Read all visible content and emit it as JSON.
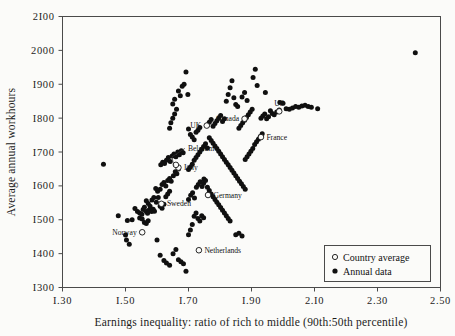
{
  "chart_data": {
    "type": "scatter",
    "title": "",
    "xlabel": "Earnings inequality: ratio of rich to middle (90th:50th percentile)",
    "ylabel": "Average annual workhours",
    "xlim": [
      1.3,
      2.5
    ],
    "ylim": [
      1300,
      2100
    ],
    "xticks": [
      1.3,
      1.5,
      1.7,
      1.9,
      2.1,
      2.3,
      2.5
    ],
    "xticklabels": [
      "1.30",
      "1.50",
      "1.70",
      "1.90",
      "2.10",
      "2.30",
      "2.50"
    ],
    "yticks": [
      1300,
      1400,
      1500,
      1600,
      1700,
      1800,
      1900,
      2000,
      2100
    ],
    "yticklabels": [
      "1300",
      "1400",
      "1500",
      "1600",
      "1700",
      "1800",
      "1900",
      "2000",
      "2100"
    ],
    "grid": false,
    "legend_position": "bottom-right",
    "legend": [
      {
        "marker": "open-circle",
        "label": "Country average"
      },
      {
        "marker": "filled-dot",
        "label": "Annual data"
      }
    ],
    "series": [
      {
        "name": "Annual data",
        "marker": "filled-dot",
        "points": [
          [
            1.477,
            1512
          ],
          [
            1.506,
            1498
          ],
          [
            1.5,
            1455
          ],
          [
            1.503,
            1440
          ],
          [
            1.512,
            1428
          ],
          [
            1.53,
            1533
          ],
          [
            1.538,
            1524
          ],
          [
            1.545,
            1520
          ],
          [
            1.552,
            1516
          ],
          [
            1.556,
            1530
          ],
          [
            1.56,
            1537
          ],
          [
            1.566,
            1524
          ],
          [
            1.57,
            1519
          ],
          [
            1.574,
            1528
          ],
          [
            1.579,
            1527
          ],
          [
            1.583,
            1524
          ],
          [
            1.588,
            1531
          ],
          [
            1.592,
            1525
          ],
          [
            1.56,
            1492
          ],
          [
            1.566,
            1489
          ],
          [
            1.572,
            1497
          ],
          [
            1.545,
            1505
          ],
          [
            1.553,
            1502
          ],
          [
            1.521,
            1500
          ],
          [
            1.598,
            1552
          ],
          [
            1.604,
            1566
          ],
          [
            1.61,
            1590
          ],
          [
            1.616,
            1604
          ],
          [
            1.622,
            1610
          ],
          [
            1.628,
            1600
          ],
          [
            1.634,
            1616
          ],
          [
            1.64,
            1622
          ],
          [
            1.645,
            1614
          ],
          [
            1.652,
            1630
          ],
          [
            1.658,
            1642
          ],
          [
            1.663,
            1636
          ],
          [
            1.668,
            1650
          ],
          [
            1.612,
            1662
          ],
          [
            1.618,
            1670
          ],
          [
            1.624,
            1666
          ],
          [
            1.63,
            1676
          ],
          [
            1.636,
            1684
          ],
          [
            1.642,
            1672
          ],
          [
            1.648,
            1688
          ],
          [
            1.654,
            1694
          ],
          [
            1.66,
            1686
          ],
          [
            1.666,
            1700
          ],
          [
            1.671,
            1692
          ],
          [
            1.677,
            1704
          ],
          [
            1.683,
            1698
          ],
          [
            1.6,
            1440
          ],
          [
            1.61,
            1395
          ],
          [
            1.622,
            1380
          ],
          [
            1.63,
            1372
          ],
          [
            1.64,
            1366
          ],
          [
            1.651,
            1400
          ],
          [
            1.66,
            1412
          ],
          [
            1.668,
            1382
          ],
          [
            1.676,
            1376
          ],
          [
            1.684,
            1370
          ],
          [
            1.692,
            1348
          ],
          [
            1.7,
            1456
          ],
          [
            1.706,
            1470
          ],
          [
            1.712,
            1486
          ],
          [
            1.718,
            1510
          ],
          [
            1.724,
            1520
          ],
          [
            1.73,
            1504
          ],
          [
            1.736,
            1496
          ],
          [
            1.742,
            1512
          ],
          [
            1.748,
            1506
          ],
          [
            1.7,
            1560
          ],
          [
            1.707,
            1572
          ],
          [
            1.713,
            1580
          ],
          [
            1.719,
            1564
          ],
          [
            1.725,
            1596
          ],
          [
            1.731,
            1604
          ],
          [
            1.737,
            1612
          ],
          [
            1.743,
            1598
          ],
          [
            1.749,
            1620
          ],
          [
            1.7,
            1648
          ],
          [
            1.706,
            1656
          ],
          [
            1.712,
            1664
          ],
          [
            1.718,
            1676
          ],
          [
            1.724,
            1684
          ],
          [
            1.73,
            1692
          ],
          [
            1.736,
            1700
          ],
          [
            1.742,
            1708
          ],
          [
            1.748,
            1716
          ],
          [
            1.754,
            1724
          ],
          [
            1.76,
            1712
          ],
          [
            1.64,
            1770
          ],
          [
            1.65,
            1800
          ],
          [
            1.656,
            1812
          ],
          [
            1.662,
            1826
          ],
          [
            1.668,
            1880
          ],
          [
            1.674,
            1866
          ],
          [
            1.68,
            1894
          ],
          [
            1.686,
            1900
          ],
          [
            1.692,
            1936
          ],
          [
            1.698,
            1870
          ],
          [
            1.644,
            1786
          ],
          [
            1.65,
            1842
          ],
          [
            1.656,
            1856
          ],
          [
            1.7,
            1768
          ],
          [
            1.706,
            1752
          ],
          [
            1.712,
            1744
          ],
          [
            1.718,
            1736
          ],
          [
            1.724,
            1758
          ],
          [
            1.73,
            1764
          ],
          [
            1.736,
            1772
          ],
          [
            1.76,
            1780
          ],
          [
            1.766,
            1788
          ],
          [
            1.772,
            1796
          ],
          [
            1.778,
            1776
          ],
          [
            1.784,
            1784
          ],
          [
            1.79,
            1792
          ],
          [
            1.796,
            1800
          ],
          [
            1.802,
            1808
          ],
          [
            1.808,
            1790
          ],
          [
            1.814,
            1798
          ],
          [
            1.766,
            1742
          ],
          [
            1.772,
            1734
          ],
          [
            1.778,
            1726
          ],
          [
            1.784,
            1718
          ],
          [
            1.79,
            1710
          ],
          [
            1.796,
            1702
          ],
          [
            1.802,
            1694
          ],
          [
            1.808,
            1686
          ],
          [
            1.814,
            1678
          ],
          [
            1.82,
            1670
          ],
          [
            1.826,
            1662
          ],
          [
            1.832,
            1654
          ],
          [
            1.838,
            1646
          ],
          [
            1.844,
            1638
          ],
          [
            1.85,
            1630
          ],
          [
            1.856,
            1622
          ],
          [
            1.862,
            1614
          ],
          [
            1.868,
            1606
          ],
          [
            1.874,
            1598
          ],
          [
            1.88,
            1590
          ],
          [
            1.88,
            1678
          ],
          [
            1.886,
            1686
          ],
          [
            1.892,
            1694
          ],
          [
            1.898,
            1702
          ],
          [
            1.904,
            1710
          ],
          [
            1.91,
            1722
          ],
          [
            1.916,
            1730
          ],
          [
            1.922,
            1738
          ],
          [
            1.928,
            1746
          ],
          [
            1.934,
            1754
          ],
          [
            1.86,
            1770
          ],
          [
            1.866,
            1778
          ],
          [
            1.872,
            1786
          ],
          [
            1.878,
            1794
          ],
          [
            1.884,
            1802
          ],
          [
            1.89,
            1810
          ],
          [
            1.896,
            1818
          ],
          [
            1.902,
            1826
          ],
          [
            1.82,
            1850
          ],
          [
            1.826,
            1870
          ],
          [
            1.832,
            1890
          ],
          [
            1.838,
            1910
          ],
          [
            1.844,
            1860
          ],
          [
            1.85,
            1840
          ],
          [
            1.856,
            1834
          ],
          [
            1.93,
            1800
          ],
          [
            1.936,
            1806
          ],
          [
            1.942,
            1812
          ],
          [
            1.948,
            1798
          ],
          [
            1.954,
            1804
          ],
          [
            1.96,
            1822
          ],
          [
            1.966,
            1814
          ],
          [
            1.972,
            1810
          ],
          [
            1.98,
            1818
          ],
          [
            1.988,
            1824
          ],
          [
            2.01,
            1828
          ],
          [
            2.02,
            1826
          ],
          [
            2.03,
            1830
          ],
          [
            2.04,
            1834
          ],
          [
            2.05,
            1832
          ],
          [
            2.06,
            1836
          ],
          [
            2.07,
            1838
          ],
          [
            2.08,
            1834
          ],
          [
            2.09,
            1832
          ],
          [
            2.11,
            1828
          ],
          [
            1.99,
            1846
          ],
          [
            2.0,
            1844
          ],
          [
            1.87,
            1862
          ],
          [
            1.878,
            1876
          ],
          [
            1.886,
            1852
          ],
          [
            1.944,
            1876
          ],
          [
            1.905,
            1920
          ],
          [
            1.912,
            1944
          ],
          [
            2.42,
            1993
          ],
          [
            1.918,
            1896
          ],
          [
            1.76,
            1596
          ],
          [
            1.766,
            1586
          ],
          [
            1.772,
            1576
          ],
          [
            1.778,
            1568
          ],
          [
            1.784,
            1560
          ],
          [
            1.79,
            1552
          ],
          [
            1.796,
            1544
          ],
          [
            1.802,
            1536
          ],
          [
            1.808,
            1528
          ],
          [
            1.814,
            1520
          ],
          [
            1.82,
            1512
          ],
          [
            1.826,
            1504
          ],
          [
            1.832,
            1496
          ],
          [
            1.748,
            1608
          ],
          [
            1.754,
            1616
          ],
          [
            1.64,
            1584
          ],
          [
            1.634,
            1576
          ],
          [
            1.628,
            1568
          ],
          [
            1.596,
            1592
          ],
          [
            1.602,
            1584
          ],
          [
            1.566,
            1556
          ],
          [
            1.572,
            1548
          ],
          [
            1.578,
            1540
          ],
          [
            1.584,
            1558
          ],
          [
            1.59,
            1566
          ],
          [
            1.43,
            1664
          ],
          [
            1.61,
            1540
          ],
          [
            1.616,
            1534
          ],
          [
            1.622,
            1546
          ],
          [
            1.85,
            1456
          ],
          [
            1.86,
            1460
          ],
          [
            1.87,
            1452
          ]
        ]
      },
      {
        "name": "Country average",
        "marker": "open-circle",
        "points": [
          {
            "label": "Norway",
            "x": 1.553,
            "y": 1463,
            "label_side": "left"
          },
          {
            "label": "Sweden",
            "x": 1.614,
            "y": 1547,
            "label_side": "right"
          },
          {
            "label": "Italy",
            "x": 1.668,
            "y": 1654,
            "label_side": "right"
          },
          {
            "label": "Belgium",
            "x": 1.66,
            "y": 1662,
            "label_side": "leader"
          },
          {
            "label": "Netherlands",
            "x": 1.733,
            "y": 1410,
            "label_side": "right"
          },
          {
            "label": "Germany",
            "x": 1.762,
            "y": 1573,
            "label_side": "right"
          },
          {
            "label": "UK",
            "x": 1.758,
            "y": 1778,
            "label_side": "left"
          },
          {
            "label": "Canada",
            "x": 1.878,
            "y": 1798,
            "label_side": "left"
          },
          {
            "label": "France",
            "x": 1.93,
            "y": 1744,
            "label_side": "right"
          },
          {
            "label": "US",
            "x": 1.988,
            "y": 1820,
            "label_side": "above"
          }
        ]
      }
    ]
  }
}
